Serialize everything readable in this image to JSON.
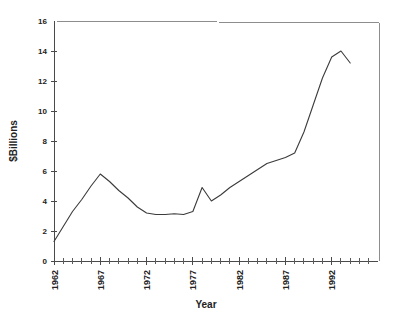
{
  "chart_data": {
    "type": "line",
    "title": "",
    "xlabel": "Year",
    "ylabel": "$Billions",
    "xlim": [
      1962,
      1994
    ],
    "ylim": [
      0,
      16
    ],
    "grid": false,
    "legend": null,
    "y_ticks": [
      0,
      2,
      4,
      6,
      8,
      10,
      12,
      14,
      16
    ],
    "y_tick_labels": [
      "0",
      "2",
      "4",
      "6",
      "8",
      "10",
      "12",
      "14",
      "16"
    ],
    "x_ticks": [
      1962,
      1967,
      1972,
      1977,
      1982,
      1987,
      1992
    ],
    "x_tick_labels": [
      "1962",
      "1967",
      "1972",
      "1977",
      "1982",
      "1987",
      "1992"
    ],
    "x_minor_tick_step": 1,
    "line_color": "#3b3b3b",
    "axis_color": "#4a4a4a",
    "x": [
      1962,
      1963,
      1964,
      1965,
      1966,
      1967,
      1968,
      1969,
      1970,
      1971,
      1972,
      1973,
      1974,
      1975,
      1976,
      1977,
      1978,
      1979,
      1980,
      1981,
      1982,
      1983,
      1984,
      1985,
      1986,
      1987,
      1988,
      1989,
      1990,
      1991,
      1992,
      1993,
      1994
    ],
    "values": [
      1.3,
      2.3,
      3.3,
      4.1,
      5.0,
      5.8,
      5.3,
      4.7,
      4.2,
      3.6,
      3.2,
      3.1,
      3.1,
      3.15,
      3.1,
      3.3,
      4.9,
      4.0,
      4.4,
      4.9,
      5.3,
      5.7,
      6.1,
      6.5,
      6.7,
      6.9,
      7.2,
      8.6,
      10.4,
      12.2,
      13.6,
      14.0,
      13.2
    ],
    "series": [
      {
        "name": "Value",
        "values": [
          1.3,
          2.3,
          3.3,
          4.1,
          5.0,
          5.8,
          5.3,
          4.7,
          4.2,
          3.6,
          3.2,
          3.1,
          3.1,
          3.15,
          3.1,
          3.3,
          4.9,
          4.0,
          4.4,
          4.9,
          5.3,
          5.7,
          6.1,
          6.5,
          6.7,
          6.9,
          7.2,
          8.6,
          10.4,
          12.2,
          13.6,
          14.0,
          13.2
        ]
      }
    ]
  }
}
